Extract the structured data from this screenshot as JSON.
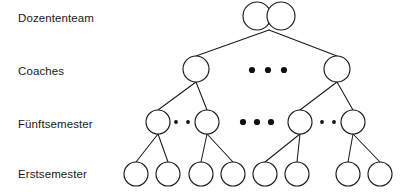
{
  "diagram": {
    "type": "hierarchy-tree",
    "background_color": "#ffffff",
    "line_color": "#1a1a1a",
    "node_fill_color": "#ffffff",
    "text_color": "#1a1a1a",
    "levels": [
      {
        "id": "dozententeam",
        "label": "Dozententeam",
        "label_x": 18,
        "label_y": 22,
        "node_y": 16,
        "node_radius": 14,
        "node_count": 2,
        "node_x": [
          257,
          281
        ],
        "ellipsis": []
      },
      {
        "id": "coaches",
        "label": "Coaches",
        "label_x": 18,
        "label_y": 75,
        "node_y": 69,
        "node_radius": 13,
        "node_count": 2,
        "node_x": [
          196,
          337
        ],
        "ellipsis": [
          {
            "kind": "big",
            "cx": 252,
            "cy": 70,
            "r": 3.1
          },
          {
            "kind": "big",
            "cx": 268,
            "cy": 70,
            "r": 3.1
          },
          {
            "kind": "big",
            "cx": 284,
            "cy": 70,
            "r": 3.1
          }
        ]
      },
      {
        "id": "fuenftsemester",
        "label": "Fünftsemester",
        "label_x": 18,
        "label_y": 128,
        "node_y": 122,
        "node_radius": 12,
        "node_count": 4,
        "node_x": [
          158,
          207,
          300,
          353
        ],
        "ellipsis": [
          {
            "kind": "small",
            "cx": 176,
            "cy": 122,
            "r": 1.9
          },
          {
            "kind": "small",
            "cx": 188,
            "cy": 122,
            "r": 1.9
          },
          {
            "kind": "big",
            "cx": 243,
            "cy": 122,
            "r": 3.1
          },
          {
            "kind": "big",
            "cx": 257,
            "cy": 122,
            "r": 3.1
          },
          {
            "kind": "big",
            "cx": 271,
            "cy": 122,
            "r": 3.1
          },
          {
            "kind": "small",
            "cx": 322,
            "cy": 122,
            "r": 1.9
          },
          {
            "kind": "small",
            "cx": 334,
            "cy": 122,
            "r": 1.9
          }
        ]
      },
      {
        "id": "erstsemester",
        "label": "Erstsemester",
        "label_x": 18,
        "label_y": 178,
        "node_y": 174,
        "node_radius": 12,
        "node_count": 8,
        "node_x": [
          136,
          168,
          201,
          233,
          265,
          297,
          348,
          380
        ],
        "ellipsis": []
      }
    ],
    "edges": [
      {
        "from": "dozententeam-apex",
        "to": "coaches-1",
        "x1": 269,
        "y1": 30,
        "x2": 196,
        "y2": 56
      },
      {
        "from": "dozententeam-apex",
        "to": "coaches-2",
        "x1": 269,
        "y1": 30,
        "x2": 337,
        "y2": 56
      },
      {
        "from": "coaches-1",
        "to": "fuenft-1",
        "x1": 196,
        "y1": 82,
        "x2": 158,
        "y2": 110
      },
      {
        "from": "coaches-1",
        "to": "fuenft-2",
        "x1": 196,
        "y1": 82,
        "x2": 207,
        "y2": 110
      },
      {
        "from": "coaches-2",
        "to": "fuenft-3",
        "x1": 337,
        "y1": 82,
        "x2": 300,
        "y2": 110
      },
      {
        "from": "coaches-2",
        "to": "fuenft-4",
        "x1": 337,
        "y1": 82,
        "x2": 353,
        "y2": 110
      },
      {
        "from": "fuenft-1",
        "to": "erst-1",
        "x1": 158,
        "y1": 134,
        "x2": 136,
        "y2": 162
      },
      {
        "from": "fuenft-1",
        "to": "erst-2",
        "x1": 158,
        "y1": 134,
        "x2": 168,
        "y2": 162
      },
      {
        "from": "fuenft-2",
        "to": "erst-3",
        "x1": 207,
        "y1": 134,
        "x2": 201,
        "y2": 162
      },
      {
        "from": "fuenft-2",
        "to": "erst-4",
        "x1": 207,
        "y1": 134,
        "x2": 233,
        "y2": 162
      },
      {
        "from": "fuenft-3",
        "to": "erst-5",
        "x1": 300,
        "y1": 134,
        "x2": 265,
        "y2": 162
      },
      {
        "from": "fuenft-3",
        "to": "erst-6",
        "x1": 300,
        "y1": 134,
        "x2": 297,
        "y2": 162
      },
      {
        "from": "fuenft-4",
        "to": "erst-7",
        "x1": 353,
        "y1": 134,
        "x2": 348,
        "y2": 162
      },
      {
        "from": "fuenft-4",
        "to": "erst-8",
        "x1": 353,
        "y1": 134,
        "x2": 380,
        "y2": 162
      }
    ]
  }
}
